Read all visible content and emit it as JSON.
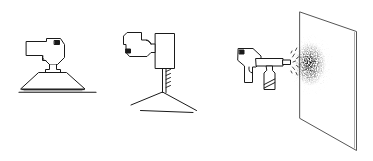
{
  "image": {
    "title": "Power tool application illustrations",
    "description": "Three-panel black-and-white line drawing of handheld power tool usages",
    "width": 373,
    "height": 161,
    "background_color": "#ffffff",
    "line_color": "#1a1a1a",
    "stipple_color": "#111111"
  },
  "figures": [
    {
      "id": "figure-1",
      "name": "heat-gun-over-conical-workpiece",
      "label": "",
      "parts": [
        "gun-body",
        "gun-barrel",
        "trigger",
        "rear-vent-block",
        "nozzle-collar",
        "conical-shade-workpiece",
        "work-surface-line"
      ]
    },
    {
      "id": "figure-2",
      "name": "drill-driver-into-corner-joint",
      "label": "",
      "parts": [
        "gun-body",
        "rear-vent-block",
        "trigger",
        "motor-housing-rectangle",
        "threaded-driver-bit",
        "corner-joint-ridge",
        "corner-joint-seam"
      ]
    },
    {
      "id": "figure-3",
      "name": "spray-gun-painting-panel",
      "label": "",
      "parts": [
        "gun-body",
        "rear-vent-block",
        "trigger",
        "spray-barrel",
        "nozzle-tip",
        "paint-canister",
        "spray-plume",
        "spray-speckle-pattern",
        "target-panel"
      ]
    }
  ],
  "captions": []
}
